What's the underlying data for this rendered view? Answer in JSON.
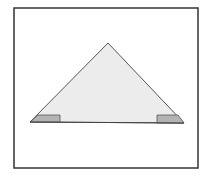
{
  "diagram": {
    "title": "",
    "frame": {
      "x": 14,
      "y": 8,
      "width": 184,
      "height": 160,
      "stroke": "#333333"
    },
    "triangle": {
      "points": [
        [
          30,
          122
        ],
        [
          108,
          43
        ],
        [
          184,
          123
        ]
      ],
      "fill": "#ececec",
      "stroke": "#555555"
    },
    "shaded_corners": [
      {
        "name": "left-corner-shading",
        "points": [
          [
            30,
            122
          ],
          [
            38,
            115
          ],
          [
            60,
            115
          ],
          [
            60,
            122
          ]
        ],
        "fill": "#b3b3b3"
      },
      {
        "name": "right-corner-shading",
        "points": [
          [
            157,
            115
          ],
          [
            178,
            115
          ],
          [
            184,
            123
          ],
          [
            157,
            123
          ]
        ],
        "fill": "#b3b3b3"
      }
    ],
    "base_line": {
      "x1": 30,
      "y1": 122,
      "x2": 184,
      "y2": 123,
      "stroke": "#444444"
    }
  }
}
